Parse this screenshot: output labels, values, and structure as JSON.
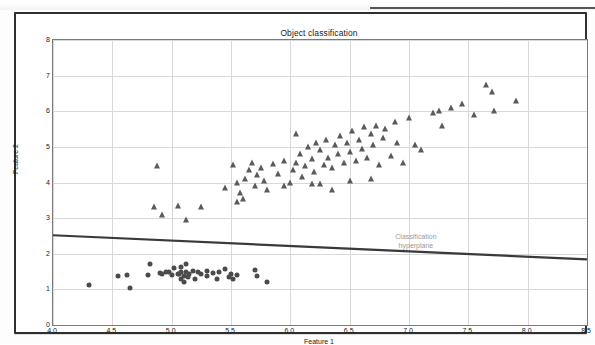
{
  "chart_data": {
    "type": "scatter",
    "title": "Object classification",
    "xlabel": "Feature 1",
    "ylabel": "Feature 2",
    "xlim": [
      4.0,
      8.5
    ],
    "ylim": [
      0,
      8
    ],
    "xticks": [
      "4.0",
      "4.5",
      "5.0",
      "5.5",
      "6.0",
      "6.5",
      "7.0",
      "7.5",
      "8.0",
      "8.5"
    ],
    "xtick_values": [
      4.0,
      4.5,
      5.0,
      5.5,
      6.0,
      6.5,
      7.0,
      7.5,
      8.0,
      8.5
    ],
    "yticks": [
      "0",
      "1",
      "2",
      "3",
      "4",
      "5",
      "6",
      "7",
      "8"
    ],
    "ytick_values": [
      0,
      1,
      2,
      3,
      4,
      5,
      6,
      7,
      8
    ],
    "grid": true,
    "legend": "none",
    "marker_colors": {
      "class_a": "#4b4b4b",
      "class_b": "#5a5a5a",
      "hyperplane": "#3a3a3a"
    },
    "annotations": [
      {
        "text": "Classification\nhyperplane",
        "x": 7.05,
        "y": 2.32,
        "color": "#9a9a9a"
      }
    ],
    "hyperplane": {
      "label": "Classification hyperplane",
      "x": [
        4.0,
        8.5
      ],
      "y": [
        2.52,
        1.84
      ]
    },
    "series": [
      {
        "name": "class_a",
        "marker": "circle",
        "points": [
          [
            4.3,
            1.12
          ],
          [
            4.55,
            1.37
          ],
          [
            4.62,
            1.4
          ],
          [
            4.65,
            1.05
          ],
          [
            4.8,
            1.4
          ],
          [
            4.82,
            1.72
          ],
          [
            4.9,
            1.45
          ],
          [
            4.92,
            1.42
          ],
          [
            4.95,
            1.5
          ],
          [
            5.0,
            1.4
          ],
          [
            5.02,
            1.6
          ],
          [
            5.05,
            1.42
          ],
          [
            5.08,
            1.3
          ],
          [
            5.08,
            1.5
          ],
          [
            5.08,
            1.62
          ],
          [
            5.1,
            1.38
          ],
          [
            5.1,
            1.2
          ],
          [
            5.12,
            1.5
          ],
          [
            5.12,
            1.72
          ],
          [
            5.15,
            1.42
          ],
          [
            5.18,
            1.52
          ],
          [
            5.2,
            1.3
          ],
          [
            5.22,
            1.48
          ],
          [
            5.25,
            1.44
          ],
          [
            5.3,
            1.38
          ],
          [
            5.35,
            1.46
          ],
          [
            5.38,
            1.3
          ],
          [
            5.4,
            1.48
          ],
          [
            5.45,
            1.56
          ],
          [
            5.48,
            1.35
          ],
          [
            5.5,
            1.44
          ],
          [
            5.52,
            1.28
          ],
          [
            5.55,
            1.4
          ],
          [
            5.7,
            1.55
          ],
          [
            5.72,
            1.38
          ],
          [
            5.8,
            1.2
          ],
          [
            4.98,
            1.48
          ],
          [
            5.06,
            1.44
          ],
          [
            5.14,
            1.34
          ],
          [
            5.3,
            1.52
          ]
        ]
      },
      {
        "name": "class_b",
        "marker": "triangle",
        "points": [
          [
            4.85,
            3.3
          ],
          [
            4.88,
            4.45
          ],
          [
            4.92,
            3.1
          ],
          [
            5.05,
            3.35
          ],
          [
            5.12,
            2.95
          ],
          [
            5.25,
            3.3
          ],
          [
            5.45,
            3.85
          ],
          [
            5.52,
            4.5
          ],
          [
            5.55,
            4.0
          ],
          [
            5.58,
            3.7
          ],
          [
            5.6,
            3.55
          ],
          [
            5.62,
            4.1
          ],
          [
            5.65,
            4.35
          ],
          [
            5.68,
            4.55
          ],
          [
            5.7,
            3.9
          ],
          [
            5.72,
            4.2
          ],
          [
            5.75,
            4.4
          ],
          [
            5.78,
            4.05
          ],
          [
            5.8,
            3.8
          ],
          [
            5.85,
            4.52
          ],
          [
            5.9,
            4.25
          ],
          [
            5.95,
            4.6
          ],
          [
            6.0,
            4.0
          ],
          [
            6.02,
            4.35
          ],
          [
            6.05,
            4.55
          ],
          [
            6.08,
            4.8
          ],
          [
            6.1,
            4.15
          ],
          [
            6.12,
            4.45
          ],
          [
            6.15,
            5.0
          ],
          [
            6.18,
            4.65
          ],
          [
            6.2,
            4.3
          ],
          [
            6.22,
            5.1
          ],
          [
            6.25,
            4.9
          ],
          [
            6.28,
            4.5
          ],
          [
            6.3,
            5.2
          ],
          [
            6.32,
            4.7
          ],
          [
            6.35,
            4.4
          ],
          [
            6.38,
            5.05
          ],
          [
            6.4,
            4.8
          ],
          [
            6.42,
            5.3
          ],
          [
            6.45,
            4.55
          ],
          [
            6.48,
            5.1
          ],
          [
            6.5,
            4.85
          ],
          [
            6.52,
            5.45
          ],
          [
            6.55,
            4.6
          ],
          [
            6.58,
            5.2
          ],
          [
            6.6,
            4.95
          ],
          [
            6.62,
            5.55
          ],
          [
            6.65,
            4.7
          ],
          [
            6.68,
            5.35
          ],
          [
            6.7,
            5.05
          ],
          [
            6.72,
            5.6
          ],
          [
            6.75,
            4.5
          ],
          [
            6.78,
            5.25
          ],
          [
            6.8,
            5.5
          ],
          [
            6.85,
            4.75
          ],
          [
            6.88,
            5.7
          ],
          [
            6.9,
            5.1
          ],
          [
            6.95,
            4.55
          ],
          [
            7.0,
            5.8
          ],
          [
            7.05,
            5.05
          ],
          [
            7.1,
            4.9
          ],
          [
            7.2,
            5.95
          ],
          [
            7.25,
            6.0
          ],
          [
            7.28,
            5.6
          ],
          [
            7.35,
            6.1
          ],
          [
            7.45,
            6.2
          ],
          [
            7.55,
            5.9
          ],
          [
            7.65,
            6.75
          ],
          [
            7.7,
            6.55
          ],
          [
            7.72,
            6.0
          ],
          [
            7.9,
            6.3
          ],
          [
            6.05,
            5.35
          ],
          [
            6.18,
            3.95
          ],
          [
            6.25,
            3.95
          ],
          [
            6.35,
            3.8
          ],
          [
            5.55,
            3.45
          ],
          [
            5.95,
            3.9
          ],
          [
            6.5,
            4.05
          ],
          [
            6.68,
            4.1
          ]
        ]
      }
    ]
  }
}
